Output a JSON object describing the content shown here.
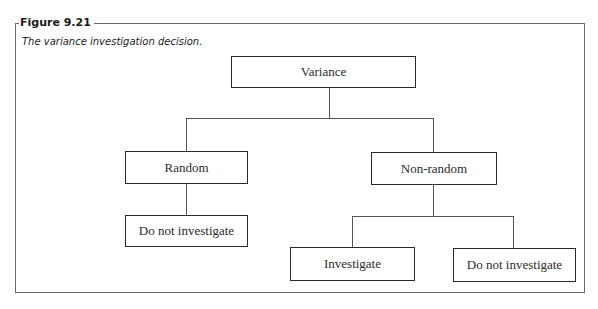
{
  "figure": {
    "label": "Figure 9.21",
    "caption": "The variance investigation decision."
  },
  "diagram": {
    "type": "tree",
    "nodes": [
      {
        "id": "variance",
        "label": "Variance",
        "parent": null
      },
      {
        "id": "random",
        "label": "Random",
        "parent": "variance"
      },
      {
        "id": "non_random",
        "label": "Non-random",
        "parent": "variance"
      },
      {
        "id": "random_dni",
        "label": "Do not investigate",
        "parent": "random"
      },
      {
        "id": "investigate",
        "label": "Investigate",
        "parent": "non_random"
      },
      {
        "id": "nonrandom_dni",
        "label": "Do not investigate",
        "parent": "non_random"
      }
    ]
  }
}
